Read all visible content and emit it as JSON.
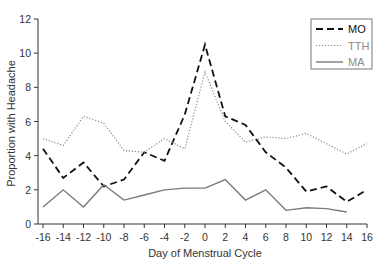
{
  "chart_data": {
    "type": "line",
    "title": "",
    "xlabel": "Day of Menstrual Cycle",
    "ylabel": "Proportion with Headache",
    "xlim": [
      -16,
      16
    ],
    "ylim": [
      0,
      12
    ],
    "xticks": [
      -16,
      -14,
      -12,
      -10,
      -8,
      -6,
      -4,
      -2,
      0,
      2,
      4,
      6,
      8,
      10,
      12,
      14,
      16
    ],
    "yticks": [
      0,
      2,
      4,
      6,
      8,
      10,
      12
    ],
    "grid": false,
    "legend_position": "top-right",
    "x": [
      -16,
      -14,
      -12,
      -10,
      -8,
      -6,
      -4,
      -2,
      0,
      2,
      4,
      6,
      8,
      10,
      12,
      14,
      16
    ],
    "series": [
      {
        "name": "MO",
        "style": "dashed",
        "color": "#111111",
        "values": [
          4.4,
          2.7,
          3.6,
          2.2,
          2.6,
          4.2,
          3.7,
          6.4,
          10.5,
          6.3,
          5.8,
          4.2,
          3.3,
          1.9,
          2.2,
          1.3,
          2.0
        ]
      },
      {
        "name": "TTH",
        "style": "dotted",
        "color": "#8a8a8a",
        "values": [
          5.0,
          4.6,
          6.3,
          5.9,
          4.3,
          4.2,
          5.0,
          4.4,
          8.9,
          6.0,
          4.8,
          5.1,
          5.0,
          5.3,
          4.7,
          4.1,
          4.7
        ]
      },
      {
        "name": "MA",
        "style": "solid",
        "color": "#7a7a7a",
        "values": [
          1.0,
          2.0,
          1.0,
          2.3,
          1.4,
          1.7,
          2.0,
          2.1,
          2.1,
          2.6,
          1.4,
          2.0,
          0.8,
          0.95,
          0.9,
          0.7,
          null
        ]
      }
    ]
  }
}
